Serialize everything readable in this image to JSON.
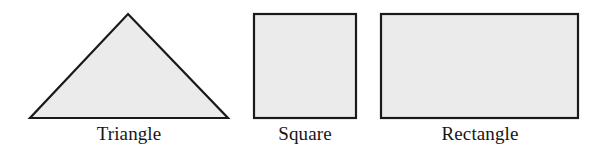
{
  "figure": {
    "background_color": "#ffffff",
    "shape_fill_color": "#ebebeb",
    "shape_stroke_color": "#1a1a1a",
    "label_color": "#161616",
    "shapes": [
      {
        "name": "triangle",
        "label": "Triangle",
        "type": "polygon",
        "points": "128,14 228,118 30,118",
        "width": 198,
        "height": 104
      },
      {
        "name": "square",
        "label": "Square",
        "type": "rect",
        "x": 254,
        "y": 14,
        "width": 102,
        "height": 104
      },
      {
        "name": "rectangle",
        "label": "Rectangle",
        "type": "rect",
        "x": 381,
        "y": 14,
        "width": 197,
        "height": 104
      }
    ]
  }
}
